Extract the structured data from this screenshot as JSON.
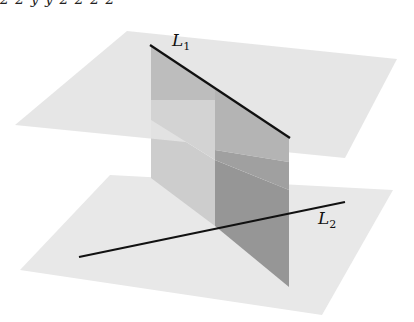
{
  "figure": {
    "top_cut_text": "2       2  y       y 2            2                   2        2",
    "labels": {
      "line1": {
        "name": "L",
        "sub": "1"
      },
      "line2": {
        "name": "L",
        "sub": "2"
      }
    },
    "colors": {
      "plane_light": "#e6e6e6",
      "plane_upper": "#e3e3e3",
      "vertical_light": "#c8c8c8",
      "vertical_dark": "#9e9e9e",
      "vertical_dark_lower": "#8f8f8f",
      "line": "#111111"
    },
    "geometry": {
      "upper_plane": [
        [
          127,
          31
        ],
        [
          397,
          59
        ],
        [
          345,
          158
        ],
        [
          15,
          125
        ]
      ],
      "lower_plane": [
        [
          110,
          175
        ],
        [
          393,
          190
        ],
        [
          322,
          315
        ],
        [
          20,
          270
        ]
      ],
      "vertical_plane_left_panel": [
        [
          151,
          46
        ],
        [
          215,
          100
        ],
        [
          215,
          226
        ],
        [
          151,
          178
        ]
      ],
      "vertical_plane_right_panel": [
        [
          215,
          100
        ],
        [
          289,
          138
        ],
        [
          289,
          287
        ],
        [
          215,
          226
        ]
      ],
      "line1": [
        [
          150,
          45
        ],
        [
          290,
          138
        ]
      ],
      "line2": [
        [
          79,
          257
        ],
        [
          345,
          202
        ]
      ]
    }
  }
}
